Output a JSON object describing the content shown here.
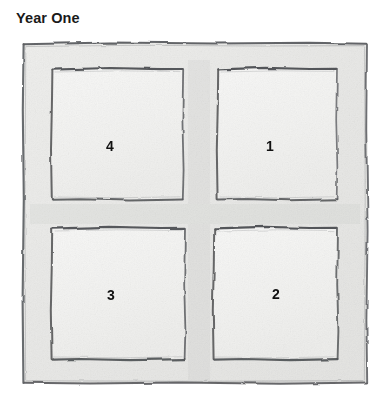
{
  "title": "Year One",
  "diagram": {
    "name": "four-quadrant-bed-sketch",
    "style": "hand-drawn pencil sketch",
    "outer_frame": {
      "label": "",
      "x": 22,
      "y": 42,
      "width": 346,
      "height": 342
    },
    "cells": [
      {
        "label": "4",
        "position": "top-left",
        "x": 51,
        "y": 68,
        "width": 132,
        "height": 132
      },
      {
        "label": "1",
        "position": "top-right",
        "x": 217,
        "y": 68,
        "width": 120,
        "height": 132
      },
      {
        "label": "3",
        "position": "bottom-left",
        "x": 51,
        "y": 227,
        "width": 134,
        "height": 133
      },
      {
        "label": "2",
        "position": "bottom-right",
        "x": 213,
        "y": 227,
        "width": 125,
        "height": 133
      }
    ]
  },
  "colors": {
    "page_background": "#ffffff",
    "title_text": "#1a1a1a",
    "label_text": "#111111",
    "paper_fill": "#ebebe9",
    "cell_fill": "#f4f4f2",
    "pencil_line": "#5f6063",
    "pencil_line_light": "#9a9b9d"
  }
}
